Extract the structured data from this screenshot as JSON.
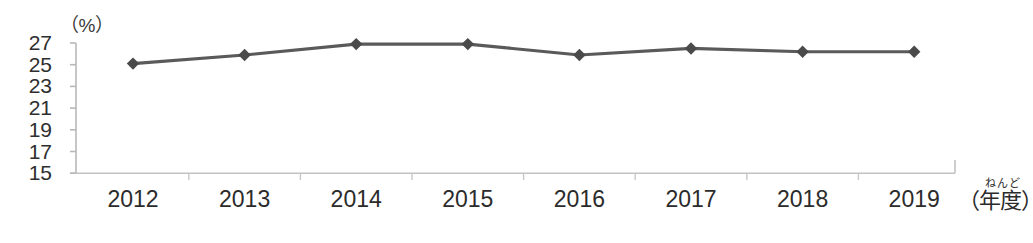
{
  "chart_data": {
    "type": "line",
    "title": "",
    "subtitle": "",
    "xlabel": "（年度）",
    "xlabel_furigana": "ねんど",
    "ylabel": "（%）",
    "categories": [
      "2012",
      "2013",
      "2014",
      "2015",
      "2016",
      "2017",
      "2018",
      "2019"
    ],
    "values": [
      25.1,
      25.9,
      26.9,
      26.9,
      25.9,
      26.5,
      26.2,
      26.2
    ],
    "series": [
      {
        "name": "",
        "values": [
          25.1,
          25.9,
          26.9,
          26.9,
          25.9,
          26.5,
          26.2,
          26.2
        ]
      }
    ],
    "ylim": [
      15,
      27
    ],
    "yticks": [
      27,
      25,
      23,
      21,
      19,
      17,
      15
    ],
    "ytick_labels": [
      "27",
      "25",
      "23",
      "21",
      "19",
      "17",
      "15"
    ],
    "grid": false,
    "legend": false,
    "legend_position": "none",
    "marker": "diamond",
    "colors": {
      "line": "#5a5a5a",
      "marker": "#4a4a4a",
      "axis": "#b8b8b8",
      "text": "#2b2b2b"
    }
  }
}
